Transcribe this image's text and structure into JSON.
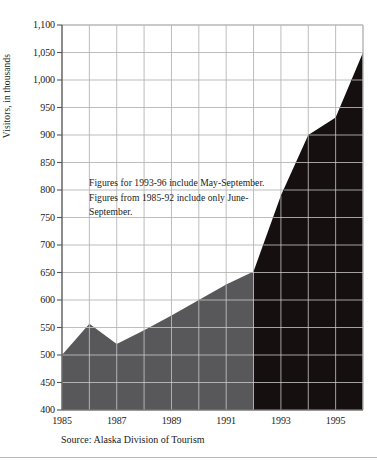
{
  "chart_data": {
    "type": "area",
    "title": "",
    "subtitle": "",
    "xlabel": "",
    "ylabel": "Visitors, in thousands",
    "x": [
      1985,
      1986,
      1987,
      1988,
      1989,
      1990,
      1991,
      1992,
      1993,
      1994,
      1995,
      1996
    ],
    "values": [
      500,
      557,
      520,
      545,
      572,
      600,
      628,
      652,
      790,
      900,
      932,
      1050
    ],
    "xlim": [
      1985,
      1996
    ],
    "ylim": [
      400,
      1100
    ],
    "yticks": [
      "400",
      "450",
      "500",
      "550",
      "600",
      "650",
      "700",
      "750",
      "800",
      "850",
      "900",
      "950",
      "1,000",
      "1,050",
      "1,100"
    ],
    "ytick_values": [
      400,
      450,
      500,
      550,
      600,
      650,
      700,
      750,
      800,
      850,
      900,
      950,
      1000,
      1050,
      1100
    ],
    "xticks": [
      "1985",
      "1987",
      "1989",
      "1991",
      "1993",
      "1995"
    ],
    "xtick_values": [
      1985,
      1987,
      1989,
      1991,
      1993,
      1995
    ],
    "grid": true,
    "legend": "none",
    "series": [
      {
        "name": "1985-92 (June-September)",
        "color": "#58585a",
        "x": [
          1985,
          1986,
          1987,
          1988,
          1989,
          1990,
          1991,
          1992
        ],
        "values": [
          500,
          557,
          520,
          545,
          572,
          600,
          628,
          652
        ]
      },
      {
        "name": "1993-96 (May-September)",
        "color": "#15100f",
        "x": [
          1992,
          1993,
          1994,
          1995,
          1996
        ],
        "values": [
          652,
          790,
          900,
          932,
          1050
        ]
      }
    ],
    "annotations": [
      {
        "name": "footnote-annotation",
        "text": "Figures for 1993-96 include May-September. Figures from 1985-92 include only June-September."
      }
    ],
    "source": "Source:  Alaska Division of Tourism",
    "colors": {
      "series_light": "#58585a",
      "series_dark": "#15100f",
      "grid_outside": "#b5b5b5",
      "grid_inside": "#e8e8e8",
      "axis": "#555555",
      "text": "#1a1a1a"
    }
  }
}
